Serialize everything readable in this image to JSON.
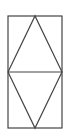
{
  "diagram": {
    "width": 72,
    "height": 136,
    "stroke_color": "#444444",
    "background": "#ffffff",
    "shapes": {
      "rectangle": {
        "x": 8,
        "y": 16,
        "w": 54,
        "h": 112
      },
      "midline": {
        "x1": 8,
        "y1": 72,
        "x2": 62,
        "y2": 72
      },
      "upper_triangle": {
        "points": "8,72 35,16 62,72"
      },
      "lower_triangle": {
        "points": "8,72 35,128 62,72"
      }
    }
  }
}
